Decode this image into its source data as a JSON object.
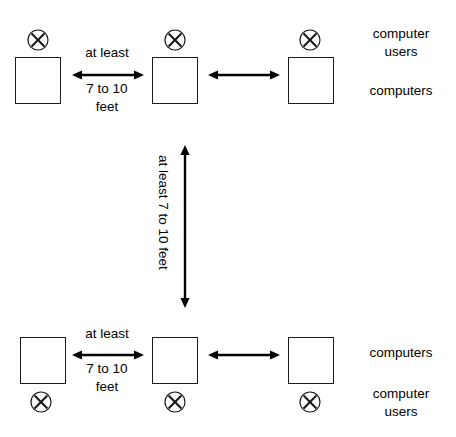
{
  "diagram": {
    "stroke_color": "#1a1a1a",
    "background_color": "#ffffff",
    "rows": [
      {
        "name": "top-row",
        "user_mark_position": "above-box",
        "side_labels": [
          {
            "text": "computer users",
            "line1": "computer",
            "line2": "users"
          },
          {
            "text": "computers",
            "line1": "computers",
            "line2": ""
          }
        ],
        "stations": [
          {
            "name": "station-1",
            "user_symbol": "X"
          },
          {
            "name": "station-2",
            "user_symbol": "X"
          },
          {
            "name": "station-3",
            "user_symbol": "X"
          }
        ],
        "arrows": [
          {
            "name": "spacing-arrow-left",
            "labeled": true,
            "label_line1": "at least",
            "label_line2": "7 to 10",
            "label_line3": "feet"
          },
          {
            "name": "spacing-arrow-right",
            "labeled": false,
            "label_line1": "",
            "label_line2": "",
            "label_line3": ""
          }
        ]
      },
      {
        "name": "bottom-row",
        "user_mark_position": "below-box",
        "side_labels": [
          {
            "text": "computers",
            "line1": "computers",
            "line2": ""
          },
          {
            "text": "computer users",
            "line1": "computer",
            "line2": "users"
          }
        ],
        "stations": [
          {
            "name": "station-4",
            "user_symbol": "X"
          },
          {
            "name": "station-5",
            "user_symbol": "X"
          },
          {
            "name": "station-6",
            "user_symbol": "X"
          }
        ],
        "arrows": [
          {
            "name": "spacing-arrow-left",
            "labeled": true,
            "label_line1": "at least",
            "label_line2": "7 to 10",
            "label_line3": "feet"
          },
          {
            "name": "spacing-arrow-right",
            "labeled": false,
            "label_line1": "",
            "label_line2": "",
            "label_line3": ""
          }
        ]
      }
    ],
    "row_spacing_arrow": {
      "name": "row-spacing-arrow",
      "orientation": "vertical",
      "label": "at least 7 to 10 feet"
    }
  }
}
